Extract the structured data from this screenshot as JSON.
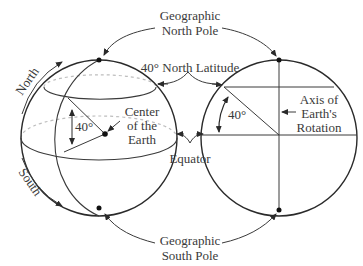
{
  "labels": {
    "north_pole_line1": "Geographic",
    "north_pole_line2": "North Pole",
    "south_pole_line1": "Geographic",
    "south_pole_line2": "South Pole",
    "latitude": "40° North Latitude",
    "center_line1": "Center",
    "center_line2": "of the",
    "center_line3": "Earth",
    "angle_left": "40°",
    "angle_right": "40°",
    "equator": "Equator",
    "axis_line1": "Axis of",
    "axis_line2": "Earth's",
    "axis_line3": "Rotation",
    "north": "North",
    "south": "South"
  },
  "colors": {
    "line": "#3a3a3a",
    "dashed": "#bdbdbd",
    "background": "#ffffff"
  }
}
